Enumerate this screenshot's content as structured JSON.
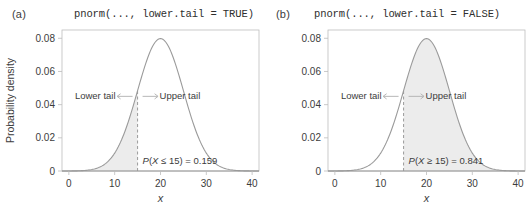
{
  "figure": {
    "width": 531,
    "height": 219,
    "background": "#ffffff"
  },
  "colors": {
    "curve": "#9a9a9a",
    "shade_fill": "#ececec",
    "frame": "#bdbdbd",
    "dashed_line": "#9a9a9a",
    "text": "#3c3c3c",
    "arrow": "#b0b0b0"
  },
  "panels": [
    {
      "id": "a",
      "letter": "(a)",
      "title": "pnorm(..., lower.tail = TRUE)",
      "annotation_lower": "Lower tail",
      "annotation_upper": "Upper tail",
      "prob_prefix": "P",
      "prob_body": "(X ≤ 15) = 0.159",
      "prob_label": "P(X ≤ 15) = 0.159",
      "shade_side": "lower",
      "cut": 15,
      "probability": 0.159
    },
    {
      "id": "b",
      "letter": "(b)",
      "title": "pnorm(..., lower.tail = FALSE)",
      "annotation_lower": "Lower tail",
      "annotation_upper": "Upper tail",
      "prob_prefix": "P",
      "prob_body": "(X ≥ 15) = 0.841",
      "prob_label": "P(X ≥ 15) = 0.841",
      "shade_side": "upper",
      "cut": 15,
      "probability": 0.841
    }
  ],
  "chart_data": {
    "type": "area",
    "xlabel": "x",
    "ylabel": "Probability density",
    "xlim": [
      -1.5,
      41.5
    ],
    "ylim": [
      0,
      0.085
    ],
    "xticks": [
      0,
      10,
      20,
      30,
      40
    ],
    "xtick_labels": [
      "0",
      "10",
      "20",
      "30",
      "40"
    ],
    "yticks": [
      0,
      0.02,
      0.04,
      0.06,
      0.08
    ],
    "ytick_labels": [
      "0",
      "0.02",
      "0.04",
      "0.06",
      "0.08"
    ],
    "grid": false,
    "legend": "none",
    "distribution": {
      "name": "normal",
      "mean": 20,
      "sd": 5,
      "peak_density": 0.0798
    },
    "series": [
      {
        "name": "normal density (mean = 20, sd = 5)",
        "x": [
          0,
          2,
          4,
          6,
          8,
          10,
          12,
          14,
          15,
          16,
          18,
          20,
          22,
          24,
          25,
          26,
          28,
          30,
          32,
          34,
          36,
          38,
          40
        ],
        "y": [
          0.0001,
          0.0004,
          0.0014,
          0.0043,
          0.0108,
          0.0216,
          0.0355,
          0.0483,
          0.0484,
          0.0579,
          0.0737,
          0.0798,
          0.0737,
          0.0579,
          0.0484,
          0.0388,
          0.0216,
          0.0108,
          0.0043,
          0.0014,
          0.0004,
          0.0001,
          0.0
        ]
      }
    ],
    "annotations": [
      {
        "panel": "a",
        "text": "Lower tail",
        "at_x": 8,
        "at_y": 0.045
      },
      {
        "panel": "a",
        "text": "Upper tail",
        "at_x": 22,
        "at_y": 0.045
      },
      {
        "panel": "a",
        "text": "P(X ≤ 15) = 0.159",
        "at_x": 19,
        "at_y": 0.004
      },
      {
        "panel": "b",
        "text": "Lower tail",
        "at_x": 8,
        "at_y": 0.045
      },
      {
        "panel": "b",
        "text": "Upper tail",
        "at_x": 22,
        "at_y": 0.045
      },
      {
        "panel": "b",
        "text": "P(X ≥ 15) = 0.841",
        "at_x": 19,
        "at_y": 0.004
      }
    ],
    "shaded_regions": [
      {
        "panel": "a",
        "from": "-inf",
        "to": 15,
        "area": 0.159
      },
      {
        "panel": "b",
        "from": 15,
        "to": "+inf",
        "area": 0.841
      }
    ]
  }
}
